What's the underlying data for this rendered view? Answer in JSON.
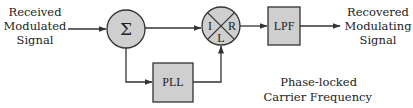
{
  "diagram": {
    "colors": {
      "block_fill": "#cfcfcf",
      "stroke": "#333333",
      "text": "#222222"
    },
    "input_label": [
      "Received",
      "Modulated",
      "Signal"
    ],
    "output_label": [
      "Recovered",
      "Modulating",
      "Signal"
    ],
    "summer": {
      "symbol": "Σ"
    },
    "mixer": {
      "ports": {
        "left": "I",
        "right": "R",
        "bottom": "L"
      }
    },
    "lpf": {
      "label": "LPF"
    },
    "pll": {
      "label": "PLL"
    },
    "pll_output_label": [
      "Phase-locked",
      "Carrier Frequency"
    ],
    "edges": [
      {
        "from": "input",
        "to": "summer"
      },
      {
        "from": "summer",
        "to": "mixer.I"
      },
      {
        "from": "summer",
        "to": "pll"
      },
      {
        "from": "pll",
        "to": "mixer.L"
      },
      {
        "from": "mixer.R",
        "to": "lpf"
      },
      {
        "from": "lpf",
        "to": "output"
      }
    ]
  }
}
